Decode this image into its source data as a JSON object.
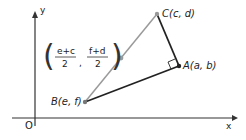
{
  "axes": {
    "x_label": "x",
    "y_label": "y",
    "origin_label": "O"
  },
  "points": {
    "A": {
      "label": "A(a, b)"
    },
    "B": {
      "label": "B(e, f)"
    },
    "C": {
      "label": "C(c, d)"
    },
    "M": {
      "num1": "e+c",
      "den1": "2",
      "num2": "f+d",
      "den2": "2"
    }
  },
  "colors": {
    "grey_side": "#999999",
    "dark_side": "#222222"
  }
}
